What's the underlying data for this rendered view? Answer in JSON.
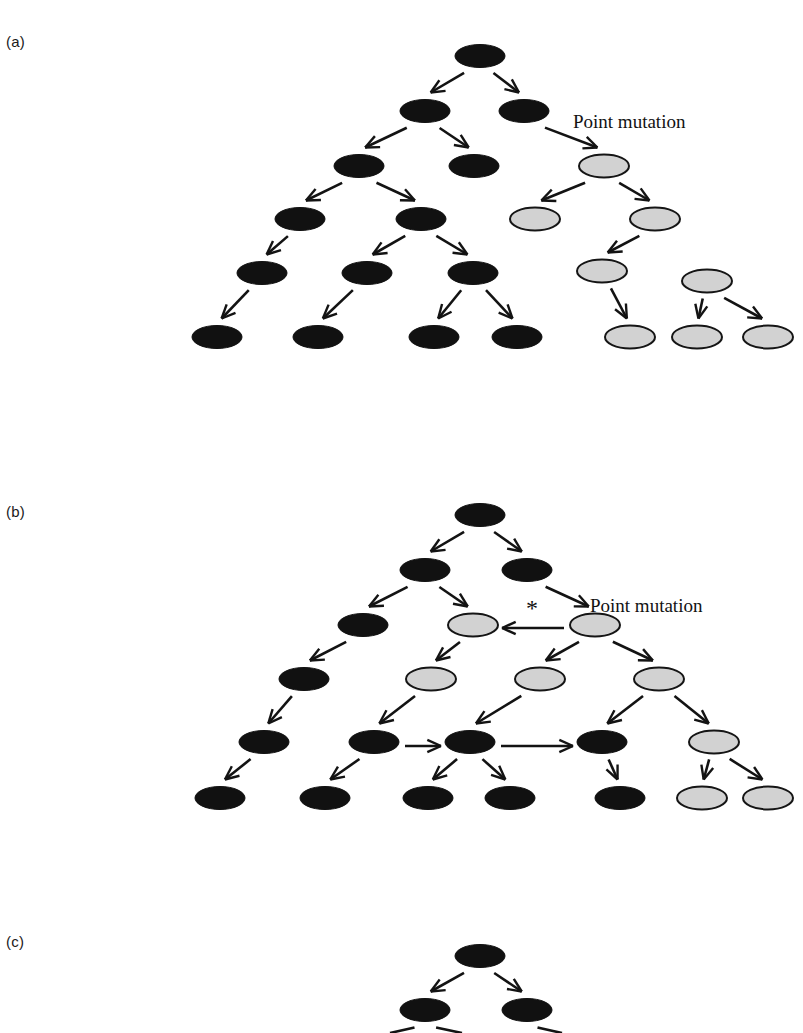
{
  "figure": {
    "title_visible": false,
    "background_color": "#ffffff",
    "width": 803,
    "height": 1033
  },
  "colors": {
    "normal_cell": "#111111",
    "mutant_cell": "#d2d2d2",
    "mutant_cell_outline": "#151515",
    "arrow": "#131313",
    "text": "#1a1a1a"
  },
  "panels": [
    {
      "id": "a",
      "label": "(a)",
      "annotations": [
        {
          "name": "point-mutation-label",
          "text": "Point mutation"
        }
      ]
    },
    {
      "id": "b",
      "label": "(b)",
      "annotations": [
        {
          "name": "point-mutation-label",
          "text": "Point mutation"
        },
        {
          "name": "asterisk-marker",
          "text": "*"
        }
      ]
    },
    {
      "id": "c",
      "label": "(c)",
      "annotations": []
    }
  ],
  "chart_data": {
    "type": "diagram",
    "diagram_kind": "cell-lineage-tree",
    "title": "",
    "legend": [
      {
        "label": "normal cell",
        "symbol": "filled black ellipse",
        "color": "#111111"
      },
      {
        "label": "mutant cell",
        "symbol": "light gray ellipse with dark outline",
        "color": "#d2d2d2"
      }
    ],
    "node_shape": "ellipse",
    "node_size_px": {
      "rx": 25,
      "ry": 11.5
    },
    "panels": [
      {
        "id": "a",
        "label": "(a)",
        "generations": 7,
        "nodes": [
          {
            "id": "a0",
            "gen": 0,
            "x": 480,
            "y": 56,
            "type": "normal"
          },
          {
            "id": "a1a",
            "gen": 1,
            "x": 425,
            "y": 111,
            "type": "normal"
          },
          {
            "id": "a1b",
            "gen": 1,
            "x": 524,
            "y": 111,
            "type": "normal"
          },
          {
            "id": "a2a",
            "gen": 2,
            "x": 359,
            "y": 166,
            "type": "normal"
          },
          {
            "id": "a2b",
            "gen": 2,
            "x": 474,
            "y": 166,
            "type": "normal"
          },
          {
            "id": "a2c",
            "gen": 2,
            "x": 604,
            "y": 166,
            "type": "mutant"
          },
          {
            "id": "a3a",
            "gen": 3,
            "x": 300,
            "y": 219,
            "type": "normal"
          },
          {
            "id": "a3b",
            "gen": 3,
            "x": 421,
            "y": 219,
            "type": "normal"
          },
          {
            "id": "a3c",
            "gen": 3,
            "x": 535,
            "y": 219,
            "type": "mutant"
          },
          {
            "id": "a3d",
            "gen": 3,
            "x": 655,
            "y": 219,
            "type": "mutant"
          },
          {
            "id": "a4a",
            "gen": 4,
            "x": 262,
            "y": 273,
            "type": "normal"
          },
          {
            "id": "a4b",
            "gen": 4,
            "x": 367,
            "y": 273,
            "type": "normal"
          },
          {
            "id": "a4c",
            "gen": 4,
            "x": 473,
            "y": 273,
            "type": "normal"
          },
          {
            "id": "a4d",
            "gen": 4,
            "x": 602,
            "y": 271,
            "type": "mutant"
          },
          {
            "id": "a4e",
            "gen": 4,
            "x": 707,
            "y": 281,
            "type": "mutant"
          },
          {
            "id": "a5a",
            "gen": 5,
            "x": 217,
            "y": 337,
            "type": "normal"
          },
          {
            "id": "a5b",
            "gen": 5,
            "x": 318,
            "y": 337,
            "type": "normal"
          },
          {
            "id": "a5c",
            "gen": 5,
            "x": 434,
            "y": 337,
            "type": "normal"
          },
          {
            "id": "a5d",
            "gen": 5,
            "x": 517,
            "y": 337,
            "type": "normal"
          },
          {
            "id": "a5e",
            "gen": 5,
            "x": 630,
            "y": 337,
            "type": "mutant"
          },
          {
            "id": "a5f",
            "gen": 5,
            "x": 697,
            "y": 337,
            "type": "mutant"
          },
          {
            "id": "a5g",
            "gen": 5,
            "x": 768,
            "y": 337,
            "type": "mutant"
          }
        ],
        "edges": [
          {
            "from": "a0",
            "to": "a1a"
          },
          {
            "from": "a0",
            "to": "a1b"
          },
          {
            "from": "a1a",
            "to": "a2a"
          },
          {
            "from": "a1a",
            "to": "a2b"
          },
          {
            "from": "a1b",
            "to": "a2c",
            "annotation": "Point mutation"
          },
          {
            "from": "a2a",
            "to": "a3a"
          },
          {
            "from": "a2a",
            "to": "a3b"
          },
          {
            "from": "a2c",
            "to": "a3c"
          },
          {
            "from": "a2c",
            "to": "a3d"
          },
          {
            "from": "a3a",
            "to": "a4a"
          },
          {
            "from": "a3b",
            "to": "a4b"
          },
          {
            "from": "a3b",
            "to": "a4c"
          },
          {
            "from": "a3d",
            "to": "a4d"
          },
          {
            "from": "a4a",
            "to": "a5a"
          },
          {
            "from": "a4b",
            "to": "a5b"
          },
          {
            "from": "a4c",
            "to": "a5c"
          },
          {
            "from": "a4c",
            "to": "a5d"
          },
          {
            "from": "a4d",
            "to": "a5e"
          },
          {
            "from": "a4e",
            "to": "a5f"
          },
          {
            "from": "a4e",
            "to": "a5g"
          }
        ]
      },
      {
        "id": "b",
        "label": "(b)",
        "generations": 7,
        "nodes": [
          {
            "id": "b0",
            "gen": 0,
            "x": 480,
            "y": 515,
            "type": "normal"
          },
          {
            "id": "b1a",
            "gen": 1,
            "x": 425,
            "y": 570,
            "type": "normal"
          },
          {
            "id": "b1b",
            "gen": 1,
            "x": 527,
            "y": 570,
            "type": "normal"
          },
          {
            "id": "b2a",
            "gen": 2,
            "x": 363,
            "y": 625,
            "type": "normal"
          },
          {
            "id": "b2b",
            "gen": 2,
            "x": 473,
            "y": 625,
            "type": "mutant"
          },
          {
            "id": "b2c",
            "gen": 2,
            "x": 595,
            "y": 625,
            "type": "mutant"
          },
          {
            "id": "b3a",
            "gen": 3,
            "x": 304,
            "y": 679,
            "type": "normal"
          },
          {
            "id": "b3b",
            "gen": 3,
            "x": 431,
            "y": 679,
            "type": "mutant"
          },
          {
            "id": "b3c",
            "gen": 3,
            "x": 540,
            "y": 679,
            "type": "mutant"
          },
          {
            "id": "b3d",
            "gen": 3,
            "x": 659,
            "y": 679,
            "type": "mutant"
          },
          {
            "id": "b4a",
            "gen": 4,
            "x": 264,
            "y": 742,
            "type": "normal"
          },
          {
            "id": "b4b",
            "gen": 4,
            "x": 374,
            "y": 742,
            "type": "normal"
          },
          {
            "id": "b4c",
            "gen": 4,
            "x": 470,
            "y": 742,
            "type": "normal"
          },
          {
            "id": "b4d",
            "gen": 4,
            "x": 602,
            "y": 742,
            "type": "normal"
          },
          {
            "id": "b4e",
            "gen": 4,
            "x": 714,
            "y": 742,
            "type": "mutant"
          },
          {
            "id": "b5a",
            "gen": 5,
            "x": 220,
            "y": 798,
            "type": "normal"
          },
          {
            "id": "b5b",
            "gen": 5,
            "x": 325,
            "y": 798,
            "type": "normal"
          },
          {
            "id": "b5c",
            "gen": 5,
            "x": 428,
            "y": 798,
            "type": "normal"
          },
          {
            "id": "b5d",
            "gen": 5,
            "x": 510,
            "y": 798,
            "type": "normal"
          },
          {
            "id": "b5e",
            "gen": 5,
            "x": 620,
            "y": 798,
            "type": "normal"
          },
          {
            "id": "b5f",
            "gen": 5,
            "x": 702,
            "y": 798,
            "type": "mutant"
          },
          {
            "id": "b5g",
            "gen": 5,
            "x": 768,
            "y": 798,
            "type": "mutant"
          }
        ],
        "edges": [
          {
            "from": "b0",
            "to": "b1a"
          },
          {
            "from": "b0",
            "to": "b1b"
          },
          {
            "from": "b1a",
            "to": "b2a"
          },
          {
            "from": "b1a",
            "to": "b2b"
          },
          {
            "from": "b1b",
            "to": "b2c",
            "annotation": "Point mutation"
          },
          {
            "from": "b2c",
            "to": "b2b",
            "kind": "horizontal-left",
            "annotation": "*"
          },
          {
            "from": "b2a",
            "to": "b3a"
          },
          {
            "from": "b2b",
            "to": "b3b"
          },
          {
            "from": "b2c",
            "to": "b3c"
          },
          {
            "from": "b2c",
            "to": "b3d"
          },
          {
            "from": "b3a",
            "to": "b4a"
          },
          {
            "from": "b3b",
            "to": "b4b"
          },
          {
            "from": "b3c",
            "to": "b4c"
          },
          {
            "from": "b3d",
            "to": "b4d"
          },
          {
            "from": "b3d",
            "to": "b4e"
          },
          {
            "from": "b4b",
            "to": "b4c",
            "kind": "horizontal-right"
          },
          {
            "from": "b4c",
            "to": "b4d",
            "kind": "horizontal-right"
          },
          {
            "from": "b4a",
            "to": "b5a"
          },
          {
            "from": "b4b",
            "to": "b5b"
          },
          {
            "from": "b4c",
            "to": "b5c"
          },
          {
            "from": "b4c",
            "to": "b5d"
          },
          {
            "from": "b4d",
            "to": "b5e"
          },
          {
            "from": "b4e",
            "to": "b5f"
          },
          {
            "from": "b4e",
            "to": "b5g"
          }
        ]
      },
      {
        "id": "c",
        "label": "(c)",
        "generations": 3,
        "truncated_at_bottom": true,
        "nodes": [
          {
            "id": "c0",
            "gen": 0,
            "x": 480,
            "y": 956,
            "type": "normal"
          },
          {
            "id": "c1a",
            "gen": 1,
            "x": 425,
            "y": 1010,
            "type": "normal"
          },
          {
            "id": "c1b",
            "gen": 1,
            "x": 527,
            "y": 1010,
            "type": "normal"
          }
        ],
        "edges": [
          {
            "from": "c0",
            "to": "c1a"
          },
          {
            "from": "c0",
            "to": "c1b"
          },
          {
            "from": "c1a",
            "to": "c2a",
            "partial": true
          },
          {
            "from": "c1a",
            "to": "c2b",
            "partial": true
          },
          {
            "from": "c1b",
            "to": "c2c",
            "partial": true
          }
        ]
      }
    ]
  }
}
